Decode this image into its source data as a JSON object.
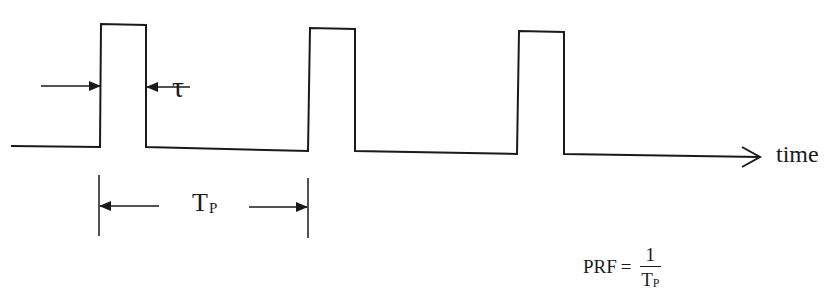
{
  "diagram": {
    "labels": {
      "pulse_width": "τ",
      "axis": "time",
      "period_main": "T",
      "period_sub": "P",
      "formula_lhs": "PRF",
      "formula_eq": "=",
      "formula_num": "1",
      "formula_den_main": "T",
      "formula_den_sub": "P"
    },
    "waveform": {
      "pulses": [
        {
          "rise_x": 101,
          "fall_x": 146,
          "top_y": 24
        },
        {
          "rise_x": 310,
          "fall_x": 355,
          "top_y": 28
        },
        {
          "rise_x": 519,
          "fall_x": 564,
          "top_y": 31
        }
      ],
      "baseline_start_x": 11,
      "baseline_end_x": 760,
      "stroke_color": "#1a1a1a"
    }
  }
}
